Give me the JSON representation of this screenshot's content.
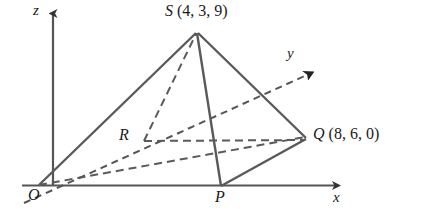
{
  "figure": {
    "background_color": "#ffffff",
    "line_color": "#5a5a5a",
    "axis_color": "#555555",
    "text_color": "#1a1a1a"
  },
  "axes": {
    "z": {
      "label": "z",
      "style": "solid",
      "arrow": true
    },
    "y": {
      "label": "y",
      "style": "dashed",
      "arrow": true
    },
    "x": {
      "label": "x",
      "style": "solid",
      "arrow": true
    }
  },
  "points": {
    "origin": {
      "label": "O",
      "coords_text": ""
    },
    "p": {
      "label": "P",
      "coords_text": ""
    },
    "r": {
      "label": "R",
      "coords_text": ""
    },
    "s": {
      "label": "S",
      "coords_text": "(4, 3, 9)"
    },
    "q": {
      "label": "Q",
      "coords_text": "(8, 6, 0)"
    }
  },
  "edges": [
    {
      "name": "O-S",
      "style": "solid"
    },
    {
      "name": "S-P",
      "style": "solid"
    },
    {
      "name": "S-Q",
      "style": "solid"
    },
    {
      "name": "P-Q",
      "style": "solid"
    },
    {
      "name": "O-P",
      "style": "solid"
    },
    {
      "name": "O-Q",
      "style": "dashed"
    },
    {
      "name": "O-R",
      "style": "dashed"
    },
    {
      "name": "R-S",
      "style": "dashed"
    },
    {
      "name": "R-Q",
      "style": "dashed"
    }
  ]
}
